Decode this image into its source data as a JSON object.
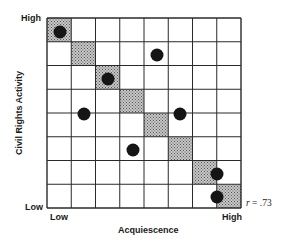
{
  "chart_data": {
    "type": "scatter",
    "title": "",
    "xlabel": "Acquiescence",
    "ylabel": "Civil Rights Activity",
    "x_tick_labels": {
      "low": "Low",
      "high": "High"
    },
    "y_tick_labels": {
      "low": "Low",
      "high": "High"
    },
    "grid": {
      "rows": 8,
      "cols": 8,
      "shown": true
    },
    "diagonal_shaded_cells": [
      [
        0,
        0
      ],
      [
        1,
        1
      ],
      [
        2,
        2
      ],
      [
        3,
        3
      ],
      [
        4,
        4
      ],
      [
        5,
        5
      ],
      [
        6,
        6
      ],
      [
        7,
        7
      ]
    ],
    "points_description": "x = acquiescence rank (1=Low..8=High), y = civil rights activity rank (8=High..1=Low)",
    "points": [
      {
        "x": 1,
        "y": 8
      },
      {
        "x": 5,
        "y": 7
      },
      {
        "x": 3,
        "y": 6
      },
      {
        "x": 2,
        "y": 4
      },
      {
        "x": 6,
        "y": 4
      },
      {
        "x": 4,
        "y": 2
      },
      {
        "x": 7.5,
        "y": 2
      },
      {
        "x": 7.5,
        "y": 1
      }
    ],
    "annotation": "r = .73",
    "xlim": [
      0,
      8
    ],
    "ylim": [
      0,
      8
    ]
  },
  "labels": {
    "y_high": "High",
    "y_low": "Low",
    "x_low": "Low",
    "x_high": "High",
    "xlabel": "Acquiescence",
    "ylabel": "Civil Rights Activity",
    "r_symbol": "r",
    "r_value": " = .73"
  },
  "colors": {
    "grid": "#2a2a2a",
    "shade": "#9a9a9a",
    "dot": "#151515"
  },
  "points_px": [
    {
      "cx": 60,
      "cy": 32
    },
    {
      "cx": 157,
      "cy": 55
    },
    {
      "cx": 108,
      "cy": 79
    },
    {
      "cx": 84,
      "cy": 114
    },
    {
      "cx": 180,
      "cy": 114
    },
    {
      "cx": 133,
      "cy": 150
    },
    {
      "cx": 217,
      "cy": 174
    },
    {
      "cx": 217,
      "cy": 197
    }
  ]
}
